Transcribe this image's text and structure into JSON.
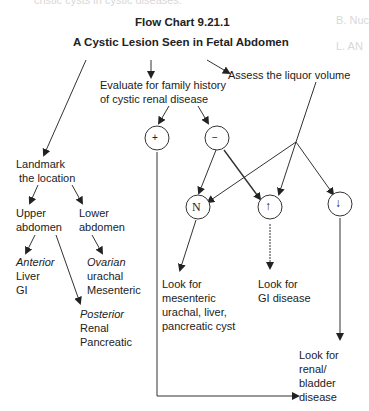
{
  "header_fragment": "cristic cysts in cystic diseases.",
  "margin_fragments": [
    "B. Nuc",
    "L. AN"
  ],
  "title": {
    "line1": "Flow Chart 9.21.1",
    "line2": "A Cystic Lesion Seen in Fetal Abdomen"
  },
  "nodes": {
    "family_history": [
      "Evaluate for family history",
      "of cystic renal disease"
    ],
    "liquor": "Assess the liquor volume",
    "plus": "+",
    "minus": "−",
    "normal": "N",
    "increased": "↑",
    "decreased": "↓",
    "landmark": [
      "Landmark",
      " the location"
    ],
    "upper": [
      "Upper",
      "abdomen"
    ],
    "lower": [
      "Lower",
      "abdomen"
    ],
    "anterior": [
      "Anterior",
      "Liver",
      "GI"
    ],
    "lower_list": [
      "Ovarian",
      "urachal",
      "Mesenteric"
    ],
    "posterior": [
      "Posterior",
      "Renal",
      "Pancreatic"
    ],
    "look_mesenteric": [
      "Look for",
      "mesenteric",
      "urachal, liver,",
      "pancreatic cyst"
    ],
    "look_gi": [
      "Look for",
      "GI disease"
    ],
    "look_renal": [
      "Look for",
      "renal/",
      "bladder",
      "disease"
    ]
  }
}
